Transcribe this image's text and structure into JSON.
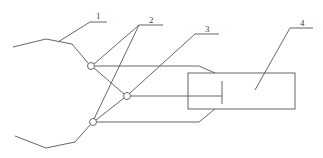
{
  "diagram": {
    "type": "schematic line drawing",
    "background": "#ffffff",
    "stroke_color": "#555555",
    "labels": [
      {
        "id": "label-1",
        "text": "1"
      },
      {
        "id": "label-2",
        "text": "2"
      },
      {
        "id": "label-3",
        "text": "3"
      },
      {
        "id": "label-4",
        "text": "4"
      }
    ],
    "components": {
      "upper_contour": "wavy line leading to upper node",
      "lower_contour": "wavy line leading to lower node",
      "nodes": 3,
      "box": "rectangle with internal vertical bar"
    }
  }
}
